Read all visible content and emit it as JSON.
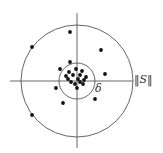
{
  "diagram": {
    "colors": {
      "line": "#555555",
      "dot": "#111111",
      "background": "#ffffff"
    },
    "center": [
      77,
      81
    ],
    "outer_circle_radius": 56,
    "inner_circle_radius": 18,
    "axes": {
      "horizontal": {
        "x1": 10,
        "x2": 133,
        "y": 81
      },
      "vertical": {
        "y1": 13,
        "y2": 148,
        "x": 77
      }
    },
    "labels": {
      "inner_radius": "δ",
      "axis": "‖S‖"
    },
    "points": [
      [
        70,
        32
      ],
      [
        32,
        47
      ],
      [
        101,
        50
      ],
      [
        70,
        62
      ],
      [
        60,
        69
      ],
      [
        105,
        74
      ],
      [
        56,
        88
      ],
      [
        95,
        99
      ],
      [
        63,
        103
      ],
      [
        32,
        115
      ],
      [
        69,
        72
      ],
      [
        76,
        69
      ],
      [
        82,
        71
      ],
      [
        66,
        76
      ],
      [
        73,
        75
      ],
      [
        80,
        75
      ],
      [
        86,
        77
      ],
      [
        68,
        79
      ],
      [
        78,
        79
      ],
      [
        84,
        80
      ],
      [
        71,
        82
      ],
      [
        80,
        82
      ],
      [
        75,
        84
      ],
      [
        83,
        84
      ],
      [
        77,
        88
      ]
    ]
  }
}
